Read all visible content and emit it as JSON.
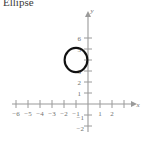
{
  "title": "Ellipse",
  "axis_labels": {
    "x": "x",
    "y": "y"
  },
  "chart_data": {
    "type": "scatter",
    "title": "Ellipse",
    "xlabel": "x",
    "ylabel": "y",
    "grid": false,
    "legend": null,
    "xlim": [
      -6.6,
      2.6
    ],
    "ylim": [
      -2.6,
      6.9
    ],
    "xticks": [
      -6,
      -5,
      -4,
      -3,
      -2,
      -1,
      1,
      2
    ],
    "yticks": [
      1,
      2,
      3,
      4,
      5,
      6
    ],
    "xticklabels": [
      "−6",
      "−5",
      "−4",
      "−3",
      "−2",
      "−1",
      "1",
      "2"
    ],
    "yticklabels": [
      "1",
      "2",
      "3",
      "4",
      "5",
      "6"
    ],
    "negative_yticks": [
      -1,
      -2
    ],
    "negative_yticklabels": [
      "−1",
      "−2"
    ],
    "shapes": [
      {
        "kind": "ellipse",
        "center_x": -1,
        "center_y": 4,
        "semi_axis_x": 0.95,
        "semi_axis_y": 1.1,
        "stroke": "#111111",
        "fill": "none",
        "stroke_width": 2.1
      }
    ]
  },
  "colors": {
    "background": "#ffffff",
    "axis": "#9a9a9a",
    "tick_text": "#6f6f6f",
    "curve": "#111111",
    "title_text": "#3a3a3a"
  },
  "ticklabels": {
    "x_neg6": "−6",
    "x_neg5": "−5",
    "x_neg4": "−4",
    "x_neg3": "−3",
    "x_neg2": "−2",
    "x_neg1": "−1",
    "x_pos1": "1",
    "x_pos2": "2",
    "y_pos1": "1",
    "y_pos2": "2",
    "y_pos3": "3",
    "y_pos5": "5",
    "y_pos6": "6",
    "y_neg1": "−1",
    "y_neg2": "−2"
  }
}
